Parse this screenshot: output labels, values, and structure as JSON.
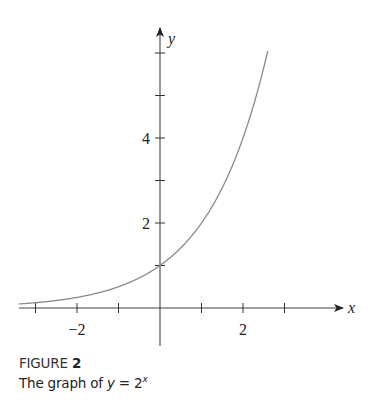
{
  "figure": {
    "label_prefix": "FIGURE",
    "label_number": "2",
    "caption_text": "The graph of ",
    "caption_var": "y",
    "caption_eq": " = 2",
    "caption_exp": "x"
  },
  "colors": {
    "axis": "#333333",
    "curve": "#8a8a8a",
    "text": "#222222"
  },
  "chart_data": {
    "type": "line",
    "function": "y = 2^x",
    "xlabel": "x",
    "ylabel": "y",
    "xlim": [
      -3.4,
      4.4
    ],
    "ylim": [
      -0.9,
      6.7
    ],
    "x_ticks": [
      -3,
      -2,
      -1,
      0,
      1,
      2,
      3
    ],
    "x_tick_labels": [
      {
        "value": -2,
        "label": "−2"
      },
      {
        "value": 2,
        "label": "2"
      }
    ],
    "y_ticks": [
      1,
      2,
      3,
      4,
      5,
      6
    ],
    "y_tick_labels": [
      {
        "value": 2,
        "label": "2"
      },
      {
        "value": 4,
        "label": "4"
      }
    ],
    "grid": false,
    "legend": null,
    "series": [
      {
        "name": "y = 2^x",
        "x": [
          -3.4,
          -3,
          -2,
          -1,
          0,
          1,
          2,
          2.5,
          2.58
        ],
        "y": [
          0.095,
          0.125,
          0.25,
          0.5,
          1,
          2,
          4,
          5.66,
          6.0
        ]
      }
    ]
  }
}
